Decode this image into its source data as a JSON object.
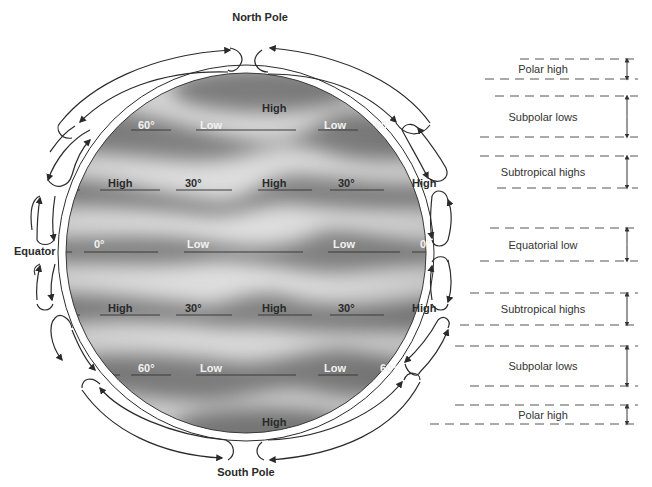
{
  "title_labels": {
    "north_pole": "North Pole",
    "south_pole": "South Pole",
    "equator": "Equator"
  },
  "globe": {
    "pressure_labels": [
      {
        "text": "High",
        "x": 262,
        "y": 112,
        "style": "bold"
      },
      {
        "text": "60°",
        "x": 138,
        "y": 129,
        "style": "white"
      },
      {
        "text": "Low",
        "x": 200,
        "y": 129,
        "style": "white"
      },
      {
        "text": "Low",
        "x": 324,
        "y": 129,
        "style": "white"
      },
      {
        "text": "60°",
        "x": 375,
        "y": 129,
        "style": "white"
      },
      {
        "text": "High",
        "x": 108,
        "y": 187,
        "style": "bold"
      },
      {
        "text": "30°",
        "x": 185,
        "y": 187,
        "style": "bold"
      },
      {
        "text": "High",
        "x": 262,
        "y": 187,
        "style": "bold"
      },
      {
        "text": "30°",
        "x": 338,
        "y": 187,
        "style": "bold"
      },
      {
        "text": "High",
        "x": 412,
        "y": 187,
        "style": "bold"
      },
      {
        "text": "0°",
        "x": 94,
        "y": 248,
        "style": "white"
      },
      {
        "text": "Low",
        "x": 187,
        "y": 248,
        "style": "white"
      },
      {
        "text": "Low",
        "x": 333,
        "y": 248,
        "style": "white"
      },
      {
        "text": "0°",
        "x": 420,
        "y": 248,
        "style": "white"
      },
      {
        "text": "High",
        "x": 108,
        "y": 312,
        "style": "bold"
      },
      {
        "text": "30°",
        "x": 185,
        "y": 312,
        "style": "bold"
      },
      {
        "text": "High",
        "x": 262,
        "y": 312,
        "style": "bold"
      },
      {
        "text": "30°",
        "x": 338,
        "y": 312,
        "style": "bold"
      },
      {
        "text": "High",
        "x": 412,
        "y": 312,
        "style": "bold"
      },
      {
        "text": "60°",
        "x": 138,
        "y": 372,
        "style": "white"
      },
      {
        "text": "Low",
        "x": 200,
        "y": 372,
        "style": "white"
      },
      {
        "text": "Low",
        "x": 324,
        "y": 372,
        "style": "white"
      },
      {
        "text": "60°",
        "x": 380,
        "y": 372,
        "style": "white"
      },
      {
        "text": "High",
        "x": 262,
        "y": 426,
        "style": "bold"
      }
    ]
  },
  "pressure_belts": [
    {
      "label": "Polar high",
      "top": 59,
      "bottom": 79
    },
    {
      "label": "Subpolar lows",
      "top": 96,
      "bottom": 137
    },
    {
      "label": "Subtropical highs",
      "top": 156,
      "bottom": 188
    },
    {
      "label": "Equatorial low",
      "top": 228,
      "bottom": 261
    },
    {
      "label": "Subtropical highs",
      "top": 293,
      "bottom": 325
    },
    {
      "label": "Subpolar lows",
      "top": 346,
      "bottom": 386
    },
    {
      "label": "Polar high",
      "top": 405,
      "bottom": 424
    }
  ],
  "colors": {
    "background": "#ffffff",
    "globe_light": "#dcdcdc",
    "globe_dark": "#7f7f7f",
    "line": "#2b2b2b",
    "text": "#2a2a2a"
  }
}
